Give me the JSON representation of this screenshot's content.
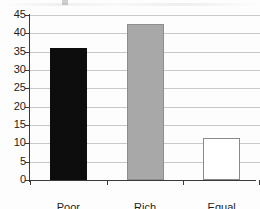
{
  "chart_data": {
    "type": "bar",
    "title": "",
    "subtitle": "",
    "xlabel": "",
    "ylabel": "",
    "categories": [
      "Poor",
      "Rich",
      "Equal"
    ],
    "values": [
      36,
      42.5,
      11.5
    ],
    "series": [
      {
        "name": "",
        "values": [
          36,
          42.5,
          11.5
        ]
      }
    ],
    "ylim": [
      0,
      45
    ],
    "yticks": [
      0,
      5,
      10,
      15,
      20,
      25,
      30,
      35,
      40,
      45
    ],
    "ytick_labels": [
      "0",
      "5",
      "10",
      "15",
      "20",
      "25",
      "30",
      "35",
      "40",
      "45"
    ],
    "grid": true,
    "grid_axis": "y",
    "legend": false,
    "legend_position": "none",
    "bar_colors": [
      "#0d0d0d",
      "#a8a8a8",
      "#ffffff"
    ],
    "bar_edge_colors": [
      "#0d0d0d",
      "#8e8e8e",
      "#8a8a8a"
    ],
    "axis_color": "#3a3a3a",
    "grid_color": "#c9c9c9",
    "background_color": "#fdfdfd",
    "annotations": []
  }
}
